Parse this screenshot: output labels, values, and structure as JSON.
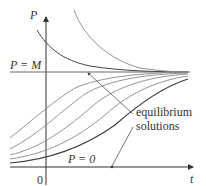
{
  "figure": {
    "type": "logistic-solution-curves",
    "axes": {
      "y_label": "P",
      "x_label": "t",
      "origin_label": "0"
    },
    "lines": {
      "upper_equilibrium_label": "P = M",
      "lower_equilibrium_label": "P = 0"
    },
    "annotation": {
      "line1": "equilibrium",
      "line2": "solutions"
    },
    "colors": {
      "axis": "#333333",
      "equilibrium": "#555555",
      "curve_light": "#8a8a8a",
      "curve_dark": "#3a3a3a",
      "text": "#333333"
    }
  }
}
